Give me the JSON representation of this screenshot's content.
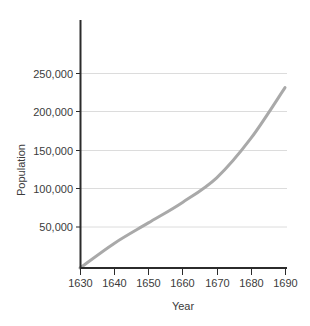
{
  "chart_data": {
    "type": "line",
    "title": "",
    "subtitle": "",
    "xlabel": "Year",
    "ylabel": "Population",
    "x": [
      1630,
      1640,
      1650,
      1660,
      1670,
      1680,
      1690
    ],
    "values": [
      0,
      30000,
      55000,
      80000,
      110000,
      158000,
      220000
    ],
    "series": [
      {
        "name": "Population",
        "values": [
          0,
          30000,
          55000,
          80000,
          110000,
          158000,
          220000
        ],
        "color": "#a9a9a9"
      }
    ],
    "xlim": [
      1630,
      1690
    ],
    "ylim": [
      0,
      270000
    ],
    "xticks": [
      1630,
      1640,
      1650,
      1660,
      1670,
      1680,
      1690
    ],
    "xtick_labels": [
      "1630",
      "1640",
      "1650",
      "1660",
      "1670",
      "1680",
      "1690"
    ],
    "yticks": [
      50000,
      100000,
      150000,
      200000,
      250000
    ],
    "ytick_labels": [
      "50,000",
      "100,000",
      "150,000",
      "200,000",
      "250,000"
    ],
    "grid": "horizontal",
    "grid_color": "#dcdcdc",
    "axis_color": "#2b2b2b",
    "legend": "none",
    "annotations": []
  },
  "axes": {
    "x_title": "Year",
    "y_title": "Population"
  },
  "ticks": {
    "x": [
      {
        "label": "1630"
      },
      {
        "label": "1640"
      },
      {
        "label": "1650"
      },
      {
        "label": "1660"
      },
      {
        "label": "1670"
      },
      {
        "label": "1680"
      },
      {
        "label": "1690"
      }
    ],
    "y": [
      {
        "label": "50,000"
      },
      {
        "label": "100,000"
      },
      {
        "label": "150,000"
      },
      {
        "label": "200,000"
      },
      {
        "label": "250,000"
      }
    ]
  }
}
